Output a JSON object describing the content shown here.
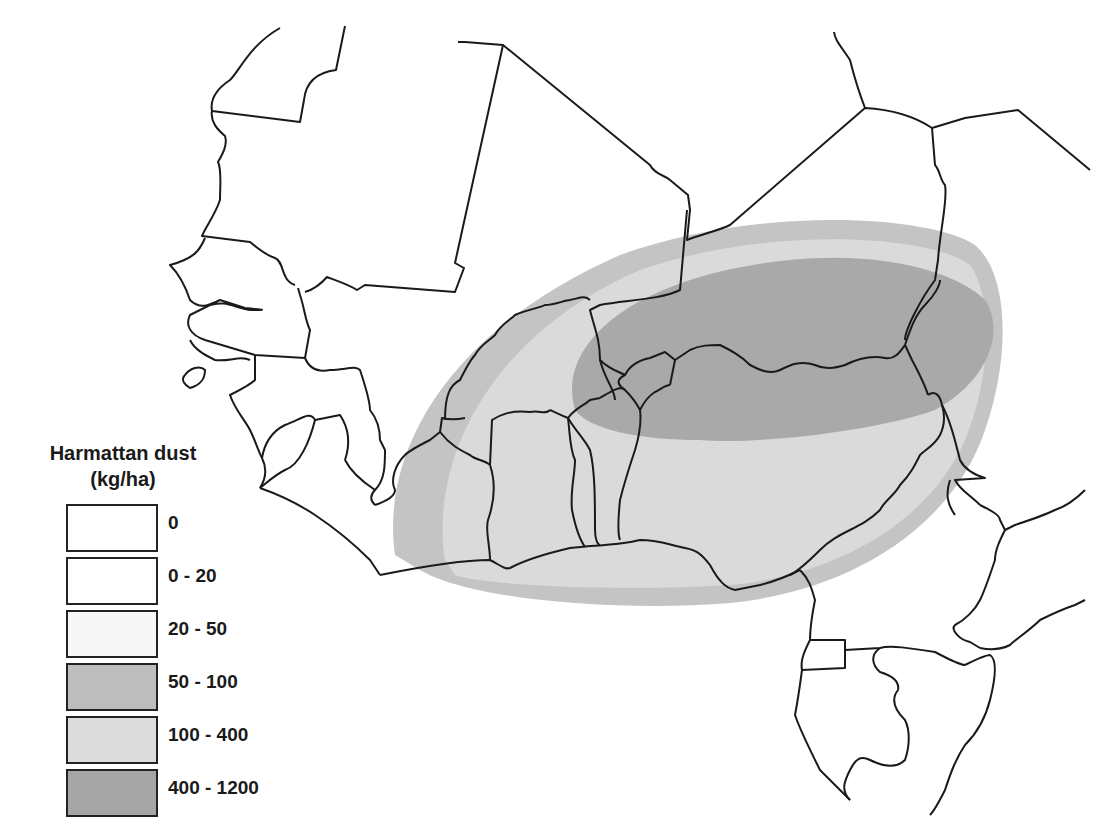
{
  "legend": {
    "title_line1": "Harmattan dust",
    "title_line2": "(kg/ha)",
    "items": [
      {
        "label": "0",
        "color": "#ffffff"
      },
      {
        "label": "0 - 20",
        "color": "#ffffff"
      },
      {
        "label": "20 - 50",
        "color": "#f7f7f7"
      },
      {
        "label": "50 - 100",
        "color": "#bdbdbd"
      },
      {
        "label": "100 - 400",
        "color": "#dcdcdc"
      },
      {
        "label": "400 - 1200",
        "color": "#a6a6a6"
      }
    ]
  },
  "map": {
    "region": "West Africa",
    "zone_colors": {
      "outer_50_100": "#c4c4c4",
      "mid_100_400": "#dadada",
      "core_400_1200": "#a9a9a9"
    },
    "border_color": "#1a1a1a"
  }
}
